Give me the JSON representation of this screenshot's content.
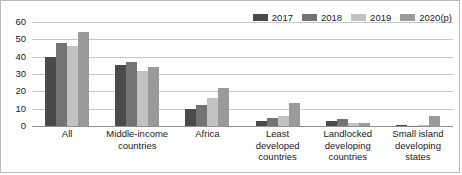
{
  "chart_data": {
    "type": "bar",
    "title": "",
    "subtitle": "",
    "xlabel": "",
    "ylabel": "",
    "ylim": [
      0,
      60
    ],
    "yticks": [
      0,
      10,
      20,
      30,
      40,
      50,
      60
    ],
    "grid": true,
    "legend_position": "top-right",
    "orientation": "vertical",
    "categories": [
      "All",
      "Middle-income countries",
      "Africa",
      "Least developed countries",
      "Landlocked developing countries",
      "Small island developing states"
    ],
    "series": [
      {
        "name": "2017",
        "color": "#4a4a4a",
        "values": [
          40,
          35,
          10,
          3,
          3,
          0.3
        ]
      },
      {
        "name": "2018",
        "color": "#737373",
        "values": [
          48,
          37,
          12,
          4.5,
          4,
          0.2
        ]
      },
      {
        "name": "2019",
        "color": "#c2c2c2",
        "values": [
          46,
          32,
          16,
          6,
          2,
          0.3
        ]
      },
      {
        "name": "2020(p)",
        "color": "#9a9a9a",
        "values": [
          54,
          34,
          22,
          13,
          1.5,
          6
        ]
      }
    ]
  },
  "style": {
    "background": "#ffffff",
    "border_color": "#b9b9b9",
    "grid_color": "#c8c8c8",
    "axis_color": "#8f8f8f",
    "text_color": "#1a1a1a"
  }
}
